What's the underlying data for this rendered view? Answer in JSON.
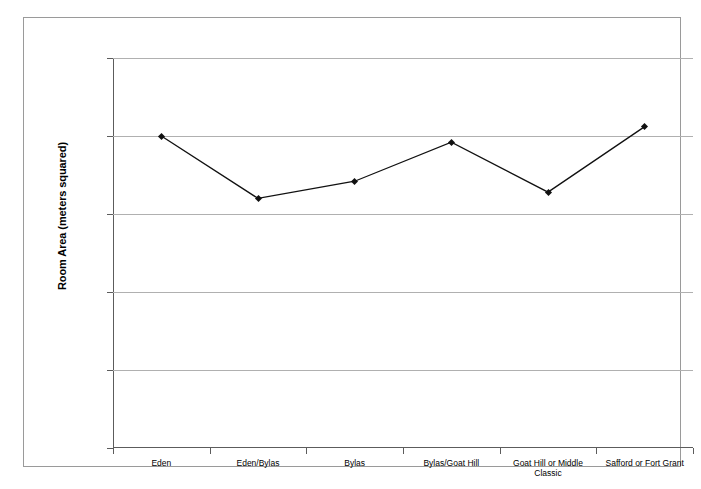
{
  "chart_data": {
    "type": "line",
    "title": "",
    "xlabel": "",
    "ylabel": "Room Area (meters squared)",
    "categories": [
      "Eden",
      "Eden/Bylas",
      "Bylas",
      "Bylas/Goat Hill",
      "Goat Hill or Middle Classic",
      "Safford or Fort Grant"
    ],
    "values": [
      20.0,
      16.0,
      17.1,
      19.6,
      16.4,
      20.6
    ],
    "ylim": [
      0,
      25
    ],
    "yticks": [
      0,
      5,
      10,
      15,
      20,
      25
    ],
    "ytick_labels": [
      "0",
      "5",
      "10",
      "15",
      "20",
      "25"
    ],
    "grid": true,
    "legend": "none",
    "series_color": "#111111",
    "gridline_color": "#b0b0b0",
    "axis_color": "#5c5c5c",
    "marker": "diamond"
  }
}
